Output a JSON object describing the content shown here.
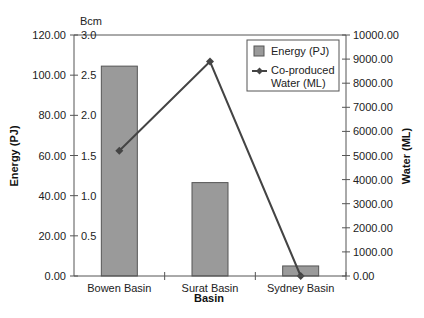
{
  "chart_data": {
    "type": "bar",
    "title": "",
    "categories": [
      "Bowen Basin",
      "Surat Basin",
      "Sydney Basin"
    ],
    "xlabel": "Basin",
    "ylabel": "Energy (PJ)",
    "ylabel_secondary_unit": "Bcm",
    "y2label": "Water (ML)",
    "ylim": [
      0,
      120
    ],
    "y_secondary_lim": [
      0,
      3.0
    ],
    "y2lim": [
      0,
      10000
    ],
    "grid": false,
    "legend_position": "upper right, inside plot",
    "left_ticks": [
      "0.00",
      "20.00",
      "40.00",
      "60.00",
      "80.00",
      "100.00",
      "120.00"
    ],
    "bcm_ticks": [
      "0.5",
      "1.0",
      "1.5",
      "2.0",
      "2.5",
      "3.0"
    ],
    "right_ticks": [
      "0.00",
      "1000.00",
      "2000.00",
      "3000.00",
      "4000.00",
      "5000.00",
      "6000.00",
      "7000.00",
      "8000.00",
      "9000.00",
      "10000.00"
    ],
    "series": [
      {
        "name": "Energy (PJ)",
        "type": "bar",
        "axis": "left",
        "color": "#9a9a9a",
        "values": [
          104.5,
          46.5,
          5.0
        ]
      },
      {
        "name": "Co-produced Water (ML)",
        "type": "line",
        "axis": "right",
        "marker": "diamond",
        "color": "#444444",
        "values": [
          5200,
          8900,
          0
        ]
      }
    ],
    "legend": [
      {
        "label": "Energy (PJ)",
        "symbol": "box"
      },
      {
        "label_line1": "Co-produced",
        "label_line2": "Water (ML)",
        "symbol": "line-diamond"
      }
    ]
  }
}
